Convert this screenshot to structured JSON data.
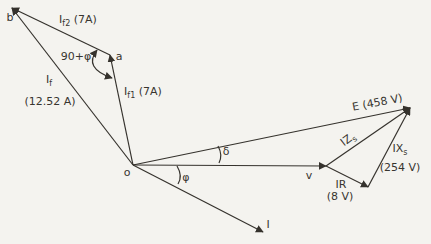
{
  "figure": {
    "type": "phasor-diagram",
    "quantities": {
      "i_f2": "7A",
      "i_f1": "7A",
      "i_f": "12.52 A",
      "e": "458 V",
      "ix_s": "254 V",
      "ir": "8 V",
      "angle_at_a": "90+φ",
      "load_angle": "δ",
      "power_factor_angle": "φ"
    }
  },
  "diagram": {
    "canvas": {
      "width": 431,
      "height": 244,
      "background": "#f4f3ef",
      "stroke": "#35322d",
      "stroke_width": 1.2
    },
    "points": {
      "o": [
        133,
        165
      ],
      "a": [
        110,
        55
      ],
      "b": [
        12,
        8
      ],
      "v": [
        326,
        166
      ],
      "e_tip": [
        410,
        108
      ],
      "ir_tip": [
        368,
        187
      ],
      "i_tip": [
        263,
        232
      ]
    },
    "vectors": [
      {
        "name": "vector-if1",
        "from": "o",
        "to": "a"
      },
      {
        "name": "vector-if2",
        "from": "a",
        "to": "b"
      },
      {
        "name": "vector-if",
        "from": "o",
        "to": "b"
      },
      {
        "name": "vector-e",
        "from": "o",
        "to": "e_tip"
      },
      {
        "name": "vector-v",
        "from": "o",
        "to": "v"
      },
      {
        "name": "vector-izs",
        "from": "v",
        "to": "e_tip"
      },
      {
        "name": "vector-ir",
        "from": "v",
        "to": "ir_tip"
      },
      {
        "name": "vector-ixs",
        "from": "ir_tip",
        "to": "e_tip"
      },
      {
        "name": "vector-i",
        "from": "o",
        "to": "i_tip"
      }
    ],
    "angle_arcs": [
      {
        "name": "arc-angle-90phi",
        "d": "M 97 50 Q 83 68 112 78",
        "arrows": "both"
      },
      {
        "name": "arc-angle-delta",
        "d": "M 218 146 Q 223 155 219 163",
        "arrows": "none"
      },
      {
        "name": "arc-angle-phi",
        "d": "M 177 166 Q 183 176 178 184",
        "arrows": "none"
      }
    ],
    "labels": [
      {
        "name": "label-point-b",
        "x": 10,
        "y": 21,
        "parts": [
          {
            "t": "b"
          }
        ]
      },
      {
        "name": "label-if2",
        "x": 78,
        "y": 23,
        "parts": [
          {
            "t": "I"
          },
          {
            "t": "f2",
            "sub": true
          },
          {
            "t": " (7A)"
          }
        ]
      },
      {
        "name": "label-angle-90phi",
        "x": 76,
        "y": 60,
        "parts": [
          {
            "t": "90+φ"
          }
        ]
      },
      {
        "name": "label-point-a",
        "x": 119,
        "y": 60,
        "parts": [
          {
            "t": "a"
          }
        ]
      },
      {
        "name": "label-if",
        "x": 49,
        "y": 83,
        "parts": [
          {
            "t": "I"
          },
          {
            "t": "f",
            "sub": true
          }
        ]
      },
      {
        "name": "label-if-value",
        "x": 50,
        "y": 105,
        "parts": [
          {
            "t": "(12.52 A)"
          }
        ]
      },
      {
        "name": "label-if1",
        "x": 143,
        "y": 95,
        "parts": [
          {
            "t": "I"
          },
          {
            "t": "f1",
            "sub": true
          },
          {
            "t": " (7A)"
          }
        ]
      },
      {
        "name": "label-point-o",
        "x": 127,
        "y": 176,
        "parts": [
          {
            "t": "o"
          }
        ]
      },
      {
        "name": "label-e",
        "x": 378,
        "y": 106,
        "rotate": -11,
        "parts": [
          {
            "t": "E (458 V)"
          }
        ]
      },
      {
        "name": "label-izs",
        "x": 350,
        "y": 142,
        "rotate": -38,
        "parts": [
          {
            "t": "IZ"
          },
          {
            "t": "s",
            "sub": true
          }
        ]
      },
      {
        "name": "label-ixs",
        "x": 400,
        "y": 152,
        "parts": [
          {
            "t": "IX"
          },
          {
            "t": "s",
            "sub": true
          }
        ]
      },
      {
        "name": "label-ixs-value",
        "x": 400,
        "y": 171,
        "parts": [
          {
            "t": "(254 V)"
          }
        ]
      },
      {
        "name": "label-point-v",
        "x": 309,
        "y": 179,
        "parts": [
          {
            "t": "v"
          }
        ]
      },
      {
        "name": "label-ir",
        "x": 341,
        "y": 188,
        "parts": [
          {
            "t": "IR"
          }
        ]
      },
      {
        "name": "label-ir-value",
        "x": 340,
        "y": 200,
        "parts": [
          {
            "t": "(8 V)"
          }
        ]
      },
      {
        "name": "label-angle-delta",
        "x": 226,
        "y": 155,
        "parts": [
          {
            "t": "δ"
          }
        ]
      },
      {
        "name": "label-angle-phi",
        "x": 186,
        "y": 181,
        "parts": [
          {
            "t": "φ"
          }
        ]
      },
      {
        "name": "label-i",
        "x": 268,
        "y": 228,
        "parts": [
          {
            "t": "I"
          }
        ]
      }
    ]
  }
}
